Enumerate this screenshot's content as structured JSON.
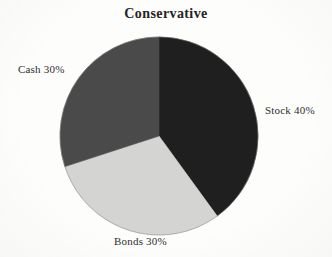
{
  "chart_data": {
    "type": "pie",
    "title": "Conservative",
    "categories": [
      "Stock",
      "Bonds",
      "Cash"
    ],
    "values": [
      40,
      30,
      30
    ],
    "labels": [
      "Stock 40%",
      "Bonds 30%",
      "Cash 30%"
    ],
    "colors": [
      "#1f1f1f",
      "#d4d4d2",
      "#4a4a4a"
    ],
    "start_angle_deg": 0,
    "direction": "clockwise",
    "legend": "none",
    "grid": false,
    "xlabel": "",
    "ylabel": "",
    "slices": [
      {
        "name": "Stock",
        "label": "Stock 40%",
        "value": 40,
        "color": "#1f1f1f",
        "start_deg": 0,
        "end_deg": 144
      },
      {
        "name": "Bonds",
        "label": "Bonds 30%",
        "value": 30,
        "color": "#d4d4d2",
        "start_deg": 144,
        "end_deg": 252
      },
      {
        "name": "Cash",
        "label": "Cash 30%",
        "value": 30,
        "color": "#4a4a4a",
        "start_deg": 252,
        "end_deg": 360
      }
    ]
  },
  "page": {
    "background_color": "#fdfdfb",
    "outline_color": "#8a8a8a"
  }
}
